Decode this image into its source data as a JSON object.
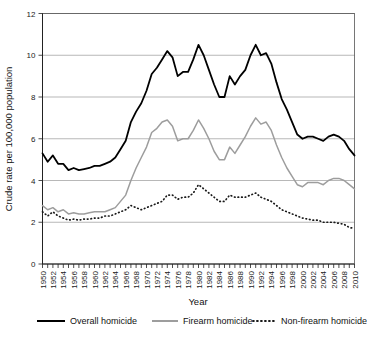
{
  "chart_data": {
    "type": "line",
    "title": "",
    "xlabel": "Year",
    "ylabel": "Crude rate per 100,000 population",
    "ylim": [
      0,
      12
    ],
    "yticks": [
      0,
      2,
      4,
      6,
      8,
      10,
      12
    ],
    "xlim": [
      1950,
      2010
    ],
    "grid": true,
    "legend_position": "bottom",
    "xticks": [
      1950,
      1952,
      1954,
      1956,
      1958,
      1960,
      1962,
      1964,
      1966,
      1968,
      1970,
      1972,
      1974,
      1976,
      1978,
      1980,
      1982,
      1984,
      1986,
      1988,
      1990,
      1992,
      1994,
      1996,
      1998,
      2000,
      2002,
      2004,
      2006,
      2008,
      2010
    ],
    "x": [
      1950,
      1951,
      1952,
      1953,
      1954,
      1955,
      1956,
      1957,
      1958,
      1959,
      1960,
      1961,
      1962,
      1963,
      1964,
      1965,
      1966,
      1967,
      1968,
      1969,
      1970,
      1971,
      1972,
      1973,
      1974,
      1975,
      1976,
      1977,
      1978,
      1979,
      1980,
      1981,
      1982,
      1983,
      1984,
      1985,
      1986,
      1987,
      1988,
      1989,
      1990,
      1991,
      1992,
      1993,
      1994,
      1995,
      1996,
      1997,
      1998,
      1999,
      2000,
      2001,
      2002,
      2003,
      2004,
      2005,
      2006,
      2007,
      2008,
      2009,
      2010
    ],
    "series": [
      {
        "name": "Overall homicide",
        "style": "solid",
        "color": "#000000",
        "values": [
          5.3,
          4.9,
          5.2,
          4.8,
          4.8,
          4.5,
          4.6,
          4.5,
          4.55,
          4.6,
          4.7,
          4.7,
          4.8,
          4.9,
          5.1,
          5.5,
          5.9,
          6.8,
          7.3,
          7.7,
          8.3,
          9.1,
          9.4,
          9.8,
          10.2,
          9.9,
          9.0,
          9.2,
          9.2,
          9.8,
          10.5,
          10.0,
          9.3,
          8.6,
          8.0,
          8.0,
          9.0,
          8.6,
          9.0,
          9.3,
          10.0,
          10.5,
          10.0,
          10.1,
          9.6,
          8.7,
          7.9,
          7.4,
          6.8,
          6.2,
          6.0,
          6.1,
          6.1,
          6.0,
          5.9,
          6.1,
          6.2,
          6.1,
          5.9,
          5.5,
          5.2
        ]
      },
      {
        "name": "Firearm homicide",
        "style": "solid-gray",
        "color": "#9d9d9d",
        "values": [
          2.8,
          2.6,
          2.7,
          2.5,
          2.6,
          2.4,
          2.45,
          2.4,
          2.4,
          2.45,
          2.5,
          2.5,
          2.5,
          2.6,
          2.7,
          3.0,
          3.3,
          4.0,
          4.6,
          5.1,
          5.6,
          6.3,
          6.5,
          6.8,
          6.9,
          6.6,
          5.9,
          6.0,
          6.0,
          6.4,
          6.9,
          6.5,
          6.0,
          5.4,
          5.0,
          5.0,
          5.6,
          5.3,
          5.7,
          6.1,
          6.6,
          7.0,
          6.7,
          6.8,
          6.4,
          5.7,
          5.1,
          4.6,
          4.2,
          3.8,
          3.7,
          3.9,
          3.9,
          3.9,
          3.8,
          4.0,
          4.1,
          4.1,
          4.0,
          3.8,
          3.6
        ]
      },
      {
        "name": "Non-firearm homicide",
        "style": "dotted",
        "color": "#1a1a1a",
        "values": [
          2.5,
          2.3,
          2.5,
          2.3,
          2.2,
          2.1,
          2.15,
          2.1,
          2.15,
          2.15,
          2.2,
          2.2,
          2.3,
          2.3,
          2.4,
          2.5,
          2.6,
          2.8,
          2.7,
          2.6,
          2.7,
          2.8,
          2.9,
          3.0,
          3.3,
          3.3,
          3.1,
          3.2,
          3.2,
          3.4,
          3.8,
          3.6,
          3.4,
          3.2,
          3.0,
          3.0,
          3.3,
          3.2,
          3.2,
          3.2,
          3.3,
          3.4,
          3.2,
          3.1,
          3.0,
          2.8,
          2.6,
          2.5,
          2.4,
          2.3,
          2.2,
          2.15,
          2.1,
          2.1,
          2.0,
          2.0,
          2.0,
          1.95,
          1.9,
          1.75,
          1.7
        ]
      }
    ]
  },
  "legend": {
    "items": [
      {
        "label": "Overall homicide",
        "marker": "solid-line-icon"
      },
      {
        "label": "Firearm homicide",
        "marker": "gray-line-icon"
      },
      {
        "label": "Non-firearm homicide",
        "marker": "dotted-line-icon"
      }
    ]
  },
  "axes": {
    "x_title": "Year",
    "y_title": "Crude rate per 100,000 population"
  }
}
